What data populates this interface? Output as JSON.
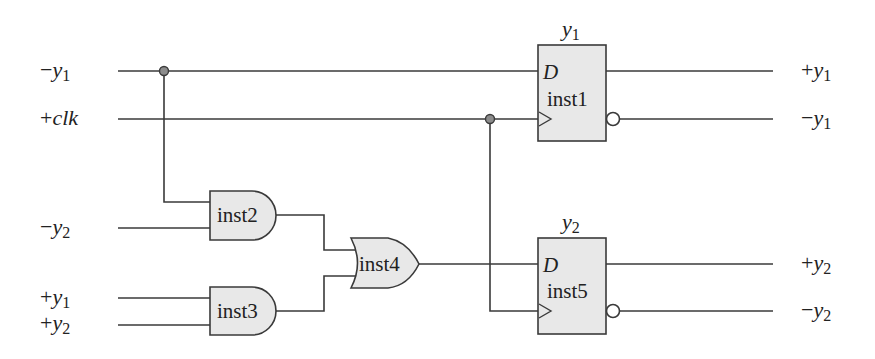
{
  "diagram": {
    "type": "logic-circuit",
    "colors": {
      "wire": "#3a3a3a",
      "gate_fill": "#e8e8e8",
      "junction_fill": "#8c8c8c",
      "background": "#ffffff"
    },
    "inputs": [
      {
        "id": "in_neg_y1",
        "sign": "−",
        "var": "y",
        "sub": "1"
      },
      {
        "id": "in_pos_clk",
        "sign": "+",
        "var": "clk",
        "sub": ""
      },
      {
        "id": "in_neg_y2",
        "sign": "−",
        "var": "y",
        "sub": "2"
      },
      {
        "id": "in_pos_y1",
        "sign": "+",
        "var": "y",
        "sub": "1"
      },
      {
        "id": "in_pos_y2",
        "sign": "+",
        "var": "y",
        "sub": "2"
      }
    ],
    "outputs": [
      {
        "id": "out_pos_y1",
        "sign": "+",
        "var": "y",
        "sub": "1"
      },
      {
        "id": "out_neg_y1",
        "sign": "−",
        "var": "y",
        "sub": "1"
      },
      {
        "id": "out_pos_y2",
        "sign": "+",
        "var": "y",
        "sub": "2"
      },
      {
        "id": "out_neg_y2",
        "sign": "−",
        "var": "y",
        "sub": "2"
      }
    ],
    "flipflops": [
      {
        "name": "inst1",
        "type": "D flip-flop",
        "title_var": "y",
        "title_sub": "1",
        "d_label": "D",
        "d_input": "−y1",
        "clk_input": "+clk"
      },
      {
        "name": "inst5",
        "type": "D flip-flop",
        "title_var": "y",
        "title_sub": "2",
        "d_label": "D",
        "d_input": "inst4",
        "clk_input": "+clk"
      }
    ],
    "gates": [
      {
        "name": "inst2",
        "type": "AND",
        "inputs": [
          "−y1",
          "−y2"
        ]
      },
      {
        "name": "inst3",
        "type": "AND",
        "inputs": [
          "+y1",
          "+y2"
        ]
      },
      {
        "name": "inst4",
        "type": "OR",
        "inputs": [
          "inst2",
          "inst3"
        ]
      }
    ]
  }
}
